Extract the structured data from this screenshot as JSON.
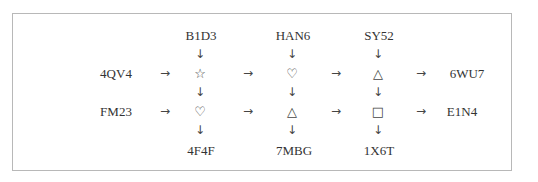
{
  "diagram": {
    "top_labels": [
      "B1D3",
      "HAN6",
      "SY52"
    ],
    "row1": {
      "input": "4QV4",
      "symbols": [
        "☆",
        "♡",
        "△"
      ],
      "output": "6WU7"
    },
    "row2": {
      "input": "FM23",
      "symbols": [
        "♡",
        "△",
        "□"
      ],
      "output": "E1N4"
    },
    "bottom_labels": [
      "4F4F",
      "7MBG",
      "1X6T"
    ],
    "arrows": {
      "right": "→",
      "down": "↓"
    },
    "colors": {
      "border": "#b8b8b8",
      "text": "#333333"
    }
  }
}
